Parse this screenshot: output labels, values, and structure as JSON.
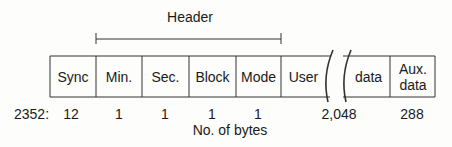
{
  "header_label": "Header",
  "fields": [
    {
      "label": "Sync",
      "bytes": "12"
    },
    {
      "label": "Min.",
      "bytes": "1"
    },
    {
      "label": "Sec.",
      "bytes": "1"
    },
    {
      "label": "Block",
      "bytes": "1"
    },
    {
      "label": "Mode",
      "bytes": "1"
    },
    {
      "label": "User",
      "bytes": "2,048"
    },
    {
      "label": "data",
      "bytes": ""
    },
    {
      "label": "Aux. data",
      "bytes": "288"
    }
  ],
  "total_label": "2352:",
  "axis_label": "No. of bytes"
}
